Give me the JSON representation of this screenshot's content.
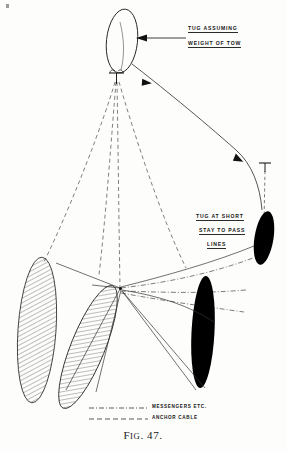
{
  "figure": {
    "caption_prefix": "F",
    "caption_small": "IG",
    "caption_rest": ". 47.",
    "caption_full": "FIG. 47."
  },
  "annotations": [
    {
      "id": "tug-assuming-weight",
      "lines": [
        "TUG ASSUMING",
        "WEIGHT OF TOW"
      ],
      "line1": "TUG ASSUMING",
      "line2": "WEIGHT OF TOW",
      "x": 188,
      "y": 28
    },
    {
      "id": "tug-at-short-stay",
      "lines": [
        "TUG AT SHORT",
        "STAY TO PASS",
        "LINES"
      ],
      "line1": "TUG AT SHORT",
      "line2": "STAY TO PASS",
      "line3": "LINES",
      "x": 196,
      "y": 215
    }
  ],
  "legend": {
    "items": [
      {
        "label": "MESSENGERS ETC.",
        "style": "dash-dot"
      },
      {
        "label": "ANCHOR CABLE",
        "style": "dashed"
      }
    ],
    "messengers_label": "MESSENGERS ETC.",
    "anchor_cable_label": "ANCHOR CABLE"
  },
  "vessels": [
    {
      "id": "tug-top-outline",
      "fill": "none",
      "kind": "outlined-hull",
      "cx": 122,
      "cy": 40
    },
    {
      "id": "tug-right-black",
      "fill": "#000000",
      "kind": "solid-hull",
      "cx": 264,
      "cy": 238
    },
    {
      "id": "tug-lower-black",
      "fill": "#000000",
      "kind": "solid-hull",
      "cx": 203,
      "cy": 330
    },
    {
      "id": "ship-hatched-left",
      "fill": "hatch",
      "kind": "hatched-hull",
      "cx": 38,
      "cy": 330
    },
    {
      "id": "ship-hatched-right",
      "fill": "hatch",
      "kind": "hatched-hull",
      "cx": 88,
      "cy": 345
    }
  ],
  "markers": [
    {
      "id": "anchor-marker-upper",
      "glyph": "T",
      "x": 116,
      "y": 78
    },
    {
      "id": "anchor-marker-right",
      "glyph": "T",
      "x": 265,
      "y": 166
    }
  ],
  "colors": {
    "ink": "#1a1a1a",
    "hull_fill_black": "#000000",
    "line_thin": "#3a3a3a",
    "dashed": "#5a5a5a",
    "background": "#fdfdfc"
  }
}
